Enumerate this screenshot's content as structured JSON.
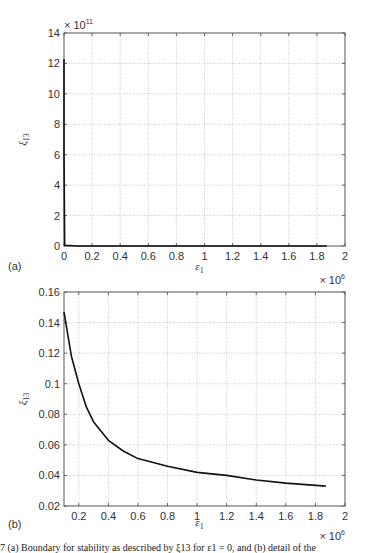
{
  "chart_data": [
    {
      "type": "line",
      "panel_label": "(a)",
      "title": "",
      "xlabel": "ε1",
      "ylabel": "ξ13",
      "x_multiplier": "× 10^6",
      "y_multiplier": "× 10^11",
      "xlim": [
        0,
        2
      ],
      "ylim": [
        0,
        14
      ],
      "xticks": [
        "0",
        "0.2",
        "0.4",
        "0.6",
        "0.8",
        "1",
        "1.2",
        "1.4",
        "1.6",
        "1.8",
        "2"
      ],
      "yticks": [
        "0",
        "2",
        "4",
        "6",
        "8",
        "10",
        "12",
        "14"
      ],
      "grid": true,
      "series": [
        {
          "name": "ξ13",
          "x": [
            0.0,
            0.0,
            0.005,
            0.1,
            0.5,
            1.0,
            1.5,
            1.87
          ],
          "y": [
            12.3,
            6.0,
            0.05,
            0.0,
            0.0,
            0.0,
            0.0,
            0.0
          ]
        }
      ]
    },
    {
      "type": "line",
      "panel_label": "(b)",
      "title": "",
      "xlabel": "ε1",
      "ylabel": "ξ13",
      "x_multiplier": "× 10^6",
      "xlim": [
        0.1,
        2
      ],
      "ylim": [
        0.02,
        0.16
      ],
      "xticks": [
        "0.2",
        "0.4",
        "0.6",
        "0.8",
        "1",
        "1.2",
        "1.4",
        "1.6",
        "1.8",
        "2"
      ],
      "yticks": [
        "0.02",
        "0.04",
        "0.06",
        "0.08",
        "0.1",
        "0.12",
        "0.14",
        "0.16"
      ],
      "grid": true,
      "series": [
        {
          "name": "ξ13",
          "x": [
            0.1,
            0.15,
            0.2,
            0.25,
            0.3,
            0.4,
            0.5,
            0.6,
            0.8,
            1.0,
            1.2,
            1.4,
            1.6,
            1.87
          ],
          "y": [
            0.147,
            0.118,
            0.1,
            0.085,
            0.075,
            0.063,
            0.056,
            0.051,
            0.046,
            0.042,
            0.04,
            0.037,
            0.035,
            0.033
          ]
        }
      ]
    }
  ],
  "caption": "7  (a) Boundary for stability as described by ξ13 for ε1 = 0, and (b) detail of the"
}
